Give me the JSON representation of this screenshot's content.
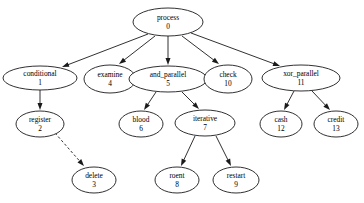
{
  "diagram": {
    "type": "directed-graph",
    "background_color": "#ffffff",
    "stroke_color": "#1a1a1a",
    "node_fill": "#ffffff",
    "nodes": [
      {
        "id": "n0",
        "name": "process",
        "number": "0",
        "cx": 168,
        "cy": 22,
        "rx": 35,
        "ry": 14
      },
      {
        "id": "n1",
        "name": "conditional",
        "number": "1",
        "cx": 40,
        "cy": 78,
        "rx": 37,
        "ry": 12
      },
      {
        "id": "n4",
        "name": "examine",
        "number": "4",
        "cx": 110,
        "cy": 79,
        "rx": 26,
        "ry": 14
      },
      {
        "id": "n5",
        "name": "and_parallel",
        "number": "5",
        "cx": 168,
        "cy": 79,
        "rx": 39,
        "ry": 13
      },
      {
        "id": "n10",
        "name": "check",
        "number": "10",
        "cx": 228,
        "cy": 79,
        "rx": 24,
        "ry": 14
      },
      {
        "id": "n11",
        "name": "xor_parallel",
        "number": "11",
        "cx": 301,
        "cy": 78,
        "rx": 39,
        "ry": 13
      },
      {
        "id": "n2",
        "name": "register",
        "number": "2",
        "cx": 40,
        "cy": 124,
        "rx": 24,
        "ry": 13
      },
      {
        "id": "n6",
        "name": "blood",
        "number": "6",
        "cx": 141,
        "cy": 124,
        "rx": 22,
        "ry": 13
      },
      {
        "id": "n7",
        "name": "iterative",
        "number": "7",
        "cx": 205,
        "cy": 123,
        "rx": 30,
        "ry": 13
      },
      {
        "id": "n12",
        "name": "cash",
        "number": "12",
        "cx": 281,
        "cy": 124,
        "rx": 21,
        "ry": 13
      },
      {
        "id": "n13",
        "name": "credit",
        "number": "13",
        "cx": 336,
        "cy": 124,
        "rx": 22,
        "ry": 13
      },
      {
        "id": "n3",
        "name": "delete",
        "number": "3",
        "cx": 94,
        "cy": 180,
        "rx": 22,
        "ry": 13
      },
      {
        "id": "n8",
        "name": "roent",
        "number": "8",
        "cx": 177,
        "cy": 180,
        "rx": 22,
        "ry": 13
      },
      {
        "id": "n9",
        "name": "restart",
        "number": "9",
        "cx": 236,
        "cy": 180,
        "rx": 23,
        "ry": 13
      }
    ],
    "edges": [
      {
        "from": "n0",
        "to": "n1",
        "style": "solid",
        "x1": 148,
        "y1": 34,
        "x2": 62,
        "y2": 67
      },
      {
        "from": "n0",
        "to": "n4",
        "style": "solid",
        "x1": 155,
        "y1": 36,
        "x2": 119,
        "y2": 64
      },
      {
        "from": "n0",
        "to": "n5",
        "style": "solid",
        "x1": 168,
        "y1": 36,
        "x2": 168,
        "y2": 65
      },
      {
        "from": "n0",
        "to": "n10",
        "style": "solid",
        "x1": 182,
        "y1": 36,
        "x2": 219,
        "y2": 64
      },
      {
        "from": "n0",
        "to": "n11",
        "style": "solid",
        "x1": 191,
        "y1": 33,
        "x2": 280,
        "y2": 66
      },
      {
        "from": "n1",
        "to": "n2",
        "style": "solid",
        "x1": 40,
        "y1": 90,
        "x2": 40,
        "y2": 110
      },
      {
        "from": "n2",
        "to": "n3",
        "style": "dashed",
        "x1": 55,
        "y1": 133,
        "x2": 84,
        "y2": 166
      },
      {
        "from": "n5",
        "to": "n6",
        "style": "solid",
        "x1": 156,
        "y1": 92,
        "x2": 144,
        "y2": 110
      },
      {
        "from": "n5",
        "to": "n7",
        "style": "solid",
        "x1": 182,
        "y1": 92,
        "x2": 199,
        "y2": 109
      },
      {
        "from": "n7",
        "to": "n8",
        "style": "solid",
        "x1": 195,
        "y1": 136,
        "x2": 181,
        "y2": 166
      },
      {
        "from": "n7",
        "to": "n9",
        "style": "solid",
        "x1": 216,
        "y1": 136,
        "x2": 231,
        "y2": 166
      },
      {
        "from": "n11",
        "to": "n12",
        "style": "solid",
        "x1": 294,
        "y1": 91,
        "x2": 284,
        "y2": 110
      },
      {
        "from": "n11",
        "to": "n13",
        "style": "solid",
        "x1": 312,
        "y1": 91,
        "x2": 330,
        "y2": 110
      }
    ]
  }
}
